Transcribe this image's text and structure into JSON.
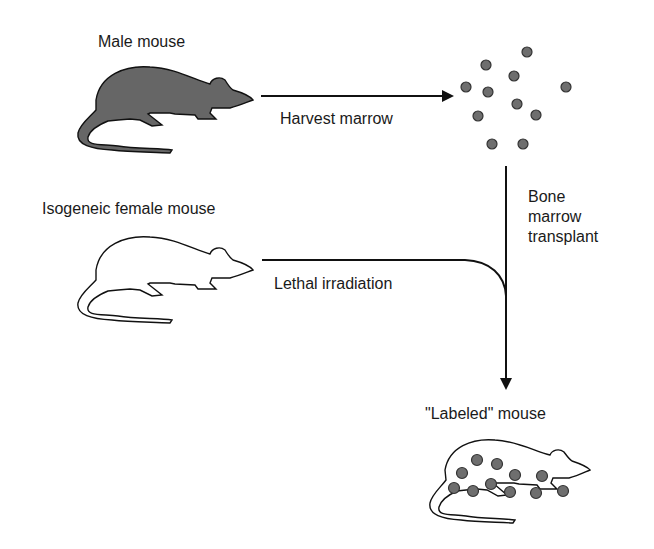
{
  "labels": {
    "male_mouse": "Male mouse",
    "female_mouse": "Isogeneic female mouse",
    "harvest": "Harvest marrow",
    "irradiation": "Lethal irradiation",
    "transplant": "Bone\nmarrow\ntransplant",
    "labeled_mouse": "\"Labeled\" mouse"
  },
  "colors": {
    "mouse_fill_dark": "#666666",
    "cell_fill": "#6e6e6e",
    "line": "#111111"
  },
  "marrow_cells": [
    [
      527,
      52
    ],
    [
      486,
      65
    ],
    [
      514,
      76
    ],
    [
      466,
      87
    ],
    [
      488,
      92
    ],
    [
      566,
      87
    ],
    [
      517,
      104
    ],
    [
      536,
      115
    ],
    [
      478,
      116
    ],
    [
      492,
      144
    ],
    [
      523,
      144
    ]
  ],
  "labeled_mouse_spots": [
    [
      477,
      460
    ],
    [
      497,
      464
    ],
    [
      462,
      473
    ],
    [
      515,
      475
    ],
    [
      542,
      476
    ],
    [
      491,
      484
    ],
    [
      454,
      488
    ],
    [
      473,
      491
    ],
    [
      510,
      492
    ],
    [
      536,
      493
    ],
    [
      563,
      491
    ]
  ]
}
